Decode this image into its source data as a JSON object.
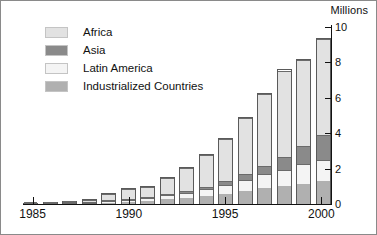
{
  "chart_data": {
    "type": "bar",
    "stacked": true,
    "title": "",
    "subtitle": "",
    "xlabel": "",
    "ylabel": "Millions",
    "units_label": "Millions",
    "ylim": [
      0,
      10
    ],
    "ytick_values": [
      0,
      2,
      4,
      6,
      8,
      10
    ],
    "ytick_labels": [
      "0",
      "2",
      "4",
      "6",
      "8",
      "10"
    ],
    "grid": false,
    "legend_position": "top-left",
    "categories": [
      "1985",
      "1986",
      "1987",
      "1988",
      "1989",
      "1990",
      "1991",
      "1992",
      "1993",
      "1994",
      "1995",
      "1996",
      "1997",
      "1998",
      "1999",
      "2000"
    ],
    "xtick_labels": [
      "1985",
      "1990",
      "1995",
      "2000"
    ],
    "xtick_categories": [
      "1985",
      "1990",
      "1995",
      "2000"
    ],
    "series": [
      {
        "name": "Industrialized Countries",
        "color": "#b0b0b0",
        "values": [
          0.02,
          0.03,
          0.04,
          0.06,
          0.1,
          0.15,
          0.2,
          0.28,
          0.35,
          0.45,
          0.6,
          0.75,
          0.9,
          1.0,
          1.15,
          1.3
        ]
      },
      {
        "name": "Latin America",
        "color": "#f4f4f4",
        "values": [
          0.01,
          0.02,
          0.02,
          0.04,
          0.07,
          0.12,
          0.18,
          0.25,
          0.3,
          0.4,
          0.5,
          0.65,
          0.8,
          0.95,
          1.1,
          1.2
        ]
      },
      {
        "name": "Asia",
        "color": "#8a8a8a",
        "values": [
          0.0,
          0.0,
          0.01,
          0.01,
          0.02,
          0.03,
          0.05,
          0.07,
          0.1,
          0.15,
          0.2,
          0.3,
          0.45,
          0.7,
          1.05,
          1.4
        ]
      },
      {
        "name": "Africa",
        "color": "#e2e2e2",
        "values": [
          0.02,
          0.05,
          0.08,
          0.19,
          0.41,
          0.6,
          0.57,
          0.9,
          1.33,
          1.8,
          2.45,
          3.2,
          4.15,
          4.95,
          4.9,
          5.5
        ]
      }
    ],
    "totals": [
      0.05,
      0.1,
      0.15,
      0.3,
      0.6,
      0.9,
      1.0,
      1.5,
      2.08,
      2.8,
      3.75,
      4.9,
      6.3,
      7.6,
      8.2,
      9.4
    ],
    "legend": [
      {
        "label": "Africa",
        "color": "#e2e2e2"
      },
      {
        "label": "Asia",
        "color": "#8a8a8a"
      },
      {
        "label": "Latin America",
        "color": "#f4f4f4"
      },
      {
        "label": "Industrialized Countries",
        "color": "#b0b0b0"
      }
    ],
    "stack_order_bottom_to_top": [
      "Industrialized Countries",
      "Latin America",
      "Asia",
      "Africa"
    ],
    "axis_color": "#111111",
    "bar_outline_color": "#5a5a5a",
    "background_color": "#ffffff",
    "frame_color": "#8a8a8a"
  }
}
